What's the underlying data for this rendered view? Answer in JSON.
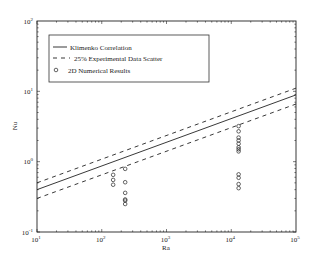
{
  "chart_data": {
    "type": "scatter",
    "title": "",
    "xlabel": "Ra",
    "ylabel": "Nu",
    "xscale": "log",
    "yscale": "log",
    "xlim": [
      10,
      100000
    ],
    "ylim": [
      0.1,
      100
    ],
    "grid": false,
    "legend_position": "upper left",
    "x_ticks": [
      "10^1",
      "10^2",
      "10^3",
      "10^4",
      "10^5"
    ],
    "y_ticks": [
      "10^-1",
      "10^0",
      "10^1",
      "10^2"
    ],
    "series": [
      {
        "name": "Klimenko Correlation",
        "style": "solid-line",
        "x": [
          10,
          100000
        ],
        "y": [
          0.4,
          8.9
        ]
      },
      {
        "name": "25% Experimental Data Scatter (upper)",
        "legend": "25% Experimental Data Scatter",
        "style": "dashed-line",
        "x": [
          10,
          100000
        ],
        "y": [
          0.5,
          11.1
        ]
      },
      {
        "name": "25% Experimental Data Scatter (lower)",
        "legend": null,
        "style": "dashed-line",
        "x": [
          10,
          100000
        ],
        "y": [
          0.3,
          6.6
        ]
      },
      {
        "name": "2D Numerical Results",
        "style": "open-circle",
        "x": [
          150,
          150,
          150,
          230,
          230,
          230,
          230,
          230,
          230,
          13000,
          13000,
          13000,
          13000,
          13000,
          13000,
          13000,
          13000,
          13000,
          13000,
          13000,
          13000
        ],
        "y": [
          0.65,
          0.55,
          0.47,
          0.79,
          0.51,
          0.36,
          0.29,
          0.28,
          0.25,
          3.2,
          2.7,
          2.2,
          2.0,
          1.8,
          1.6,
          1.5,
          1.4,
          0.66,
          0.59,
          0.48,
          0.42
        ]
      }
    ]
  },
  "axes": {
    "xlabel": "Ra",
    "ylabel": "Nu",
    "x_tick_labels": [
      {
        "base": "10",
        "exp": "1"
      },
      {
        "base": "10",
        "exp": "2"
      },
      {
        "base": "10",
        "exp": "3"
      },
      {
        "base": "10",
        "exp": "4"
      },
      {
        "base": "10",
        "exp": "5"
      }
    ],
    "y_tick_labels": [
      {
        "base": "10",
        "exp": "-1"
      },
      {
        "base": "10",
        "exp": "0"
      },
      {
        "base": "10",
        "exp": "1"
      },
      {
        "base": "10",
        "exp": "2"
      }
    ]
  },
  "legend": {
    "items": [
      {
        "label": "Klimenko Correlation"
      },
      {
        "label": "25% Experimental Data Scatter"
      },
      {
        "label": "2D Numerical Results"
      }
    ]
  }
}
